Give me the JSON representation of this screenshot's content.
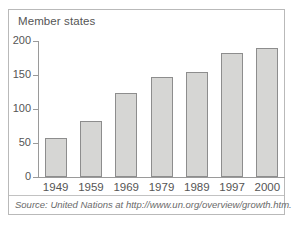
{
  "figure": {
    "title": "Member states",
    "source_prefix": "Source:",
    "source_text": " United Nations at http://www.un.org/overview/growth.htm.",
    "frame_color": "#b9b9b9",
    "axis_color": "#9a9a9a",
    "text_color": "#555555",
    "bar_fill": "#d6d6d4",
    "bar_border": "#8d8d8d",
    "background": "#ffffff"
  },
  "chart_data": {
    "type": "bar",
    "title": "Member states",
    "xlabel": "",
    "ylabel": "",
    "categories": [
      "1949",
      "1959",
      "1969",
      "1979",
      "1989",
      "1997",
      "2000"
    ],
    "values": [
      57,
      82,
      123,
      147,
      154,
      182,
      189
    ],
    "ylim": [
      0,
      200
    ],
    "yticks": [
      0,
      50,
      100,
      150,
      200
    ],
    "ytick_labels": [
      "0",
      "50",
      "100",
      "150",
      "200"
    ],
    "grid": false,
    "legend": false,
    "annotation": "Source: United Nations at http://www.un.org/overview/growth.htm."
  }
}
